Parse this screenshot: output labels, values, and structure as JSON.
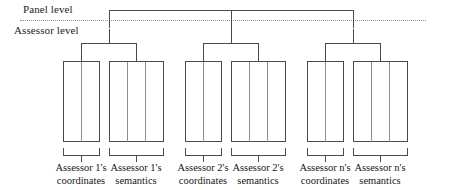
{
  "diagram": {
    "levels": {
      "panel": "Panel level",
      "assessor": "Assessor level"
    },
    "columns": [
      {
        "id": "a1-coordinates",
        "line1": "Assessor 1's",
        "line2": "coordinates",
        "cells": 2
      },
      {
        "id": "a1-semantics",
        "line1": "Assessor 1's",
        "line2": "semantics",
        "cells": 3
      },
      {
        "id": "a2-coordinates",
        "line1": "Assessor 2's",
        "line2": "coordinates",
        "cells": 2
      },
      {
        "id": "a2-semantics",
        "line1": "Assessor 2's",
        "line2": "semantics",
        "cells": 3
      },
      {
        "id": "an-coordinates",
        "line1": "Assessor n's",
        "line2": "coordinates",
        "cells": 2
      },
      {
        "id": "an-semantics",
        "line1": "Assessor n's",
        "line2": "semantics",
        "cells": 3
      }
    ],
    "colors": {
      "stroke": "#4a4a4a",
      "divider": "#8e8e8e",
      "dotted": "#8e8e8e",
      "text": "#1a1a1a",
      "background": "#ffffff"
    }
  }
}
